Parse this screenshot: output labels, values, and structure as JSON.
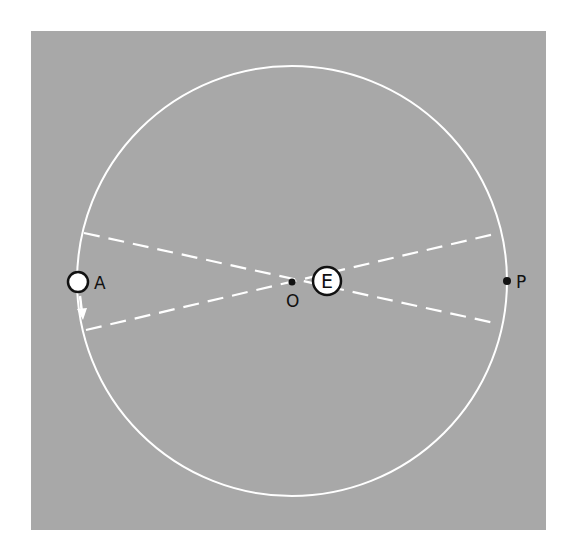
{
  "diagram": {
    "title": "",
    "background_color": "#ffffff",
    "panel_color": "#a8a8a8",
    "orbit_color": "#ffffff",
    "labels": {
      "aphelion": "A",
      "earth": "E",
      "center": "O",
      "perihelion": "P"
    },
    "elements": {
      "orbit": "circular orbit (eccentric circle)",
      "planet": "planet at A with arrow indicating motion direction (downward)",
      "earth": "Earth E, offset from center O",
      "dashed_lines": "two dashed lines crossing through E"
    }
  }
}
